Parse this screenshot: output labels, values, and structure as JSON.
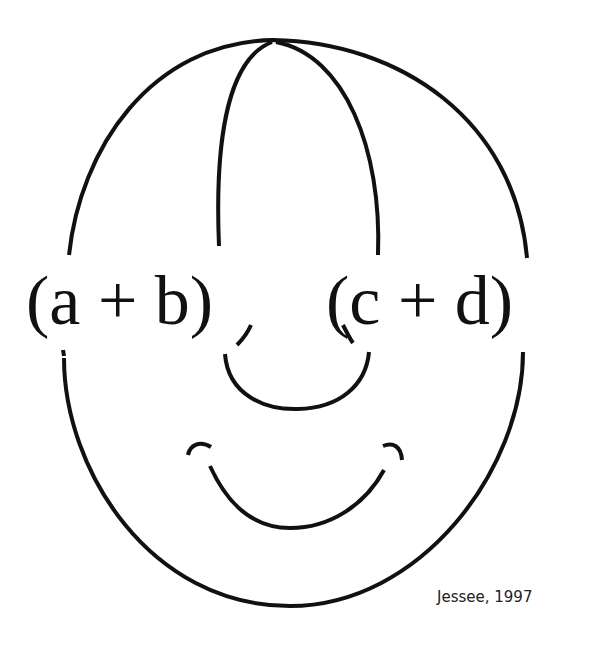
{
  "figure": {
    "type": "knot-diagram-smiley",
    "left_expression": "(a + b)",
    "right_expression": "(c + d)",
    "credit": "Jessee, 1997",
    "colors": {
      "background": "#ffffff",
      "stroke": "#111111",
      "text": "#111111"
    }
  }
}
